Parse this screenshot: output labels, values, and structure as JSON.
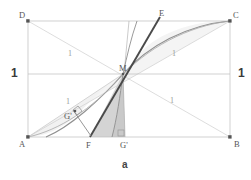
{
  "figure": {
    "caption": "a",
    "vertices": [
      {
        "id": "A",
        "label": "A",
        "x": 28,
        "y": 137,
        "label_x": 20,
        "label_y": 140
      },
      {
        "id": "B",
        "label": "B",
        "x": 230,
        "y": 137,
        "label_x": 234,
        "label_y": 140
      },
      {
        "id": "C",
        "label": "C",
        "x": 230,
        "y": 21,
        "label_x": 233,
        "label_y": 11
      },
      {
        "id": "D",
        "label": "D",
        "x": 28,
        "y": 21,
        "label_x": 19,
        "label_y": 11
      },
      {
        "id": "M",
        "label": "M",
        "x": 123,
        "y": 74,
        "label_x": 119,
        "label_y": 64
      },
      {
        "id": "E",
        "label": "E",
        "x": 160,
        "y": 17,
        "label_x": 159,
        "label_y": 9
      },
      {
        "id": "F",
        "label": "F",
        "x": 90,
        "y": 137,
        "label_x": 86,
        "label_y": 141
      },
      {
        "id": "Gp",
        "label": "G'",
        "x": 125,
        "y": 137,
        "label_x": 120,
        "label_y": 141
      },
      {
        "id": "Gq",
        "label": "G'",
        "x": 75,
        "y": 113,
        "label_x": 66,
        "label_y": 113
      }
    ],
    "unit_labels": [
      {
        "text": "1",
        "x": 68,
        "y": 52,
        "style": "unit"
      },
      {
        "text": "1",
        "x": 172,
        "y": 52,
        "style": "unit"
      },
      {
        "text": "1",
        "x": 66,
        "y": 100,
        "style": "unit"
      },
      {
        "text": "1",
        "x": 170,
        "y": 98,
        "style": "unit"
      },
      {
        "text": "1",
        "x": 11,
        "y": 71,
        "style": "unit-bold"
      },
      {
        "text": "1",
        "x": 238,
        "y": 71,
        "style": "unit-bold"
      }
    ],
    "axis_caption": {
      "text": "a",
      "x": 122,
      "y": 162
    },
    "colors": {
      "rect_border": "#b9b9b9",
      "diagonal": "#c9c9c9",
      "midline": "#b4b4b4",
      "curve_exp": "#8c8c8c",
      "curve_arc": "#9a9a9a",
      "tangent": "#4a4a4a",
      "fill_light": "#f0f0f0",
      "fill_mid": "#d8d8d8",
      "fill_dark": "#c4c4c4",
      "vertex_dot": "#555555",
      "label_text": "#5a5a5a"
    }
  }
}
